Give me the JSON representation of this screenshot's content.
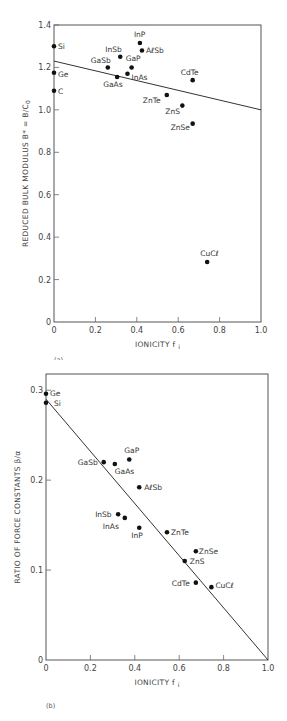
{
  "chart_data": [
    {
      "type": "scatter",
      "panel_label": "(a)",
      "xlabel": "IONICITY f",
      "xlabel_sub": "i",
      "ylabel": "REDUCED BULK MODULUS B* = B/C",
      "ylabel_sub": "0",
      "xlim": [
        0,
        1.0
      ],
      "ylim": [
        0,
        1.4
      ],
      "xticks": [
        "0",
        "0.2",
        "0.4",
        "0.6",
        "0.8",
        "1.0"
      ],
      "yticks": [
        "0",
        "0.2",
        "0.4",
        "0.6",
        "0.8",
        "1.0",
        "1.2",
        "1.4"
      ],
      "grid": false,
      "points": [
        {
          "label": "Si",
          "x": 0.0,
          "y": 1.3,
          "lx": 4,
          "ly": 3
        },
        {
          "label": "Ge",
          "x": 0.0,
          "y": 1.175,
          "lx": 4,
          "ly": 4
        },
        {
          "label": "C",
          "x": 0.0,
          "y": 1.09,
          "lx": 4,
          "ly": 3
        },
        {
          "label": "InP",
          "x": 0.415,
          "y": 1.315,
          "lx": -6,
          "ly": -6
        },
        {
          "label": "AℓSb",
          "x": 0.425,
          "y": 1.28,
          "lx": 4,
          "ly": 3
        },
        {
          "label": "InSb",
          "x": 0.32,
          "y": 1.25,
          "lx": -15,
          "ly": -5
        },
        {
          "label": "GaSb",
          "x": 0.26,
          "y": 1.2,
          "lx": -17,
          "ly": -4
        },
        {
          "label": "GaP",
          "x": 0.375,
          "y": 1.2,
          "lx": -6,
          "ly": -6
        },
        {
          "label": "InAs",
          "x": 0.355,
          "y": 1.17,
          "lx": 4,
          "ly": 6
        },
        {
          "label": "GaAs",
          "x": 0.305,
          "y": 1.155,
          "lx": -14,
          "ly": 10
        },
        {
          "label": "CdTe",
          "x": 0.67,
          "y": 1.14,
          "lx": -12,
          "ly": -5
        },
        {
          "label": "ZnTe",
          "x": 0.545,
          "y": 1.07,
          "lx": -24,
          "ly": 8
        },
        {
          "label": "ZnS",
          "x": 0.62,
          "y": 1.02,
          "lx": -17,
          "ly": 8
        },
        {
          "label": "ZnSe",
          "x": 0.67,
          "y": 0.935,
          "lx": -22,
          "ly": 6
        },
        {
          "label": "CuCℓ",
          "x": 0.74,
          "y": 0.283,
          "lx": -7,
          "ly": -6
        }
      ],
      "fit_line": {
        "x": [
          0,
          1.0
        ],
        "y": [
          1.23,
          1.0
        ]
      }
    },
    {
      "type": "scatter",
      "panel_label": "(b)",
      "xlabel": "IONICITY f",
      "xlabel_sub": "i",
      "ylabel": "RATIO OF FORCE CONSTANTS β/α",
      "xlim": [
        0,
        1.0
      ],
      "ylim": [
        0,
        0.318
      ],
      "xticks": [
        "0",
        "0.2",
        "0.4",
        "0.6",
        "0.8",
        "1.0"
      ],
      "yticks": [
        "0",
        "0.1",
        "0.2",
        "0.3"
      ],
      "grid": false,
      "points": [
        {
          "label": "Ge",
          "x": 0.0,
          "y": 0.296,
          "lx": 4,
          "ly": 2
        },
        {
          "label": "Si",
          "x": 0.0,
          "y": 0.286,
          "lx": 8,
          "ly": 3
        },
        {
          "label": "GaSb",
          "x": 0.26,
          "y": 0.22,
          "lx": -26,
          "ly": 3
        },
        {
          "label": "GaAs",
          "x": 0.31,
          "y": 0.218,
          "lx": 0,
          "ly": 10
        },
        {
          "label": "GaP",
          "x": 0.375,
          "y": 0.223,
          "lx": -5,
          "ly": -6
        },
        {
          "label": "AℓSb",
          "x": 0.42,
          "y": 0.192,
          "lx": 5,
          "ly": 3
        },
        {
          "label": "InSb",
          "x": 0.325,
          "y": 0.162,
          "lx": -23,
          "ly": 3
        },
        {
          "label": "InAs",
          "x": 0.355,
          "y": 0.158,
          "lx": -22,
          "ly": 11
        },
        {
          "label": "InP",
          "x": 0.42,
          "y": 0.147,
          "lx": -8,
          "ly": 10
        },
        {
          "label": "ZnTe",
          "x": 0.545,
          "y": 0.142,
          "lx": 4,
          "ly": 3
        },
        {
          "label": "ZnSe",
          "x": 0.675,
          "y": 0.121,
          "lx": 3,
          "ly": 3
        },
        {
          "label": "ZnS",
          "x": 0.625,
          "y": 0.11,
          "lx": 5,
          "ly": 3
        },
        {
          "label": "CdTe",
          "x": 0.675,
          "y": 0.086,
          "lx": -24,
          "ly": 3
        },
        {
          "label": "CuCℓ",
          "x": 0.745,
          "y": 0.081,
          "lx": 4,
          "ly": 1
        }
      ],
      "fit_line": {
        "x": [
          0,
          1.0
        ],
        "y": [
          0.29,
          0.0
        ]
      }
    }
  ]
}
